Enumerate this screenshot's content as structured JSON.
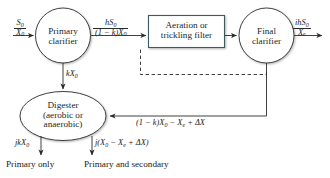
{
  "diagram": {
    "nodes": {
      "primary_clarifier": {
        "line1": "Primary",
        "line2": "clarifier",
        "shape": "circle"
      },
      "aeration": {
        "line1": "Aeration or",
        "line2": "trickling filter",
        "shape": "rectangle"
      },
      "final_clarifier": {
        "line1": "Final",
        "line2": "clarifier",
        "shape": "circle"
      },
      "digester": {
        "line1": "Digester",
        "line2": "(aerobic or",
        "line3": "anaerobic)",
        "shape": "ellipse"
      }
    },
    "flows": {
      "influent": {
        "numerator": "S",
        "numerator_sub": "0",
        "denominator": "X",
        "denominator_sub": "0"
      },
      "primary_effluent": {
        "numerator": "hS",
        "numerator_sub": "0",
        "denominator": "(1 − k)X",
        "denominator_sub": "0"
      },
      "final_effluent": {
        "numerator": "ihS",
        "numerator_sub": "0",
        "denominator": "X",
        "denominator_sub": "e"
      },
      "primary_sludge": {
        "text": "kX",
        "sub": "0"
      },
      "secondary_sludge": {
        "part1": "(1 − k)X",
        "sub1": "0",
        "part2": " − X",
        "sub2": "e",
        "part3": " + ΔX"
      },
      "digested_primary": {
        "text": "jkX",
        "sub": "0"
      },
      "digested_combined": {
        "part1": "j(X",
        "sub1": "0",
        "part2": " − X",
        "sub2": "e",
        "part3": " + ΔX)"
      }
    },
    "captions": {
      "primary_only": "Primary only",
      "primary_and_secondary": "Primary and secondary"
    },
    "colors": {
      "box_border": "#3d5a5f",
      "line": "#2b2b2b",
      "dashed_line": "#2b2b2b",
      "text": "#1a1a1a",
      "background": "#ffffff"
    }
  }
}
